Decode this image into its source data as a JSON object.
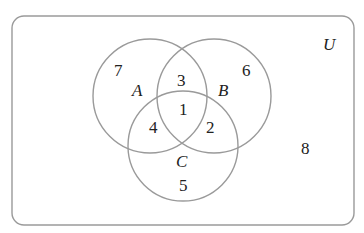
{
  "diagram": {
    "type": "venn",
    "universe_label": "U",
    "sets": [
      {
        "id": "A",
        "label": "A"
      },
      {
        "id": "B",
        "label": "B"
      },
      {
        "id": "C",
        "label": "C"
      }
    ],
    "regions": {
      "A_only": "7",
      "B_only": "6",
      "C_only": "5",
      "A_and_B_only": "3",
      "A_and_C_only": "4",
      "B_and_C_only": "2",
      "A_and_B_and_C": "1",
      "outside": "8"
    },
    "colors": {
      "stroke": "#9a9a9a",
      "text": "#222222",
      "background": "#ffffff"
    }
  }
}
